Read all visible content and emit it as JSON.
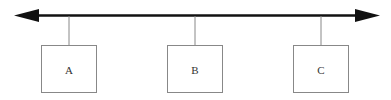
{
  "diagram": {
    "type": "bus-topology",
    "line": {
      "y": 15,
      "x1": 14,
      "x2": 380,
      "color": "#111111",
      "arrows": "both"
    },
    "nodes": [
      {
        "label": "A",
        "x": 41,
        "y": 45,
        "w": 56,
        "h": 48,
        "stem_x": 69
      },
      {
        "label": "B",
        "x": 167,
        "y": 45,
        "w": 56,
        "h": 48,
        "stem_x": 195
      },
      {
        "label": "C",
        "x": 293,
        "y": 45,
        "w": 56,
        "h": 48,
        "stem_x": 321
      }
    ],
    "colors": {
      "line": "#111111",
      "box_border": "#888888",
      "stem": "#888888",
      "text": "#333333"
    }
  }
}
